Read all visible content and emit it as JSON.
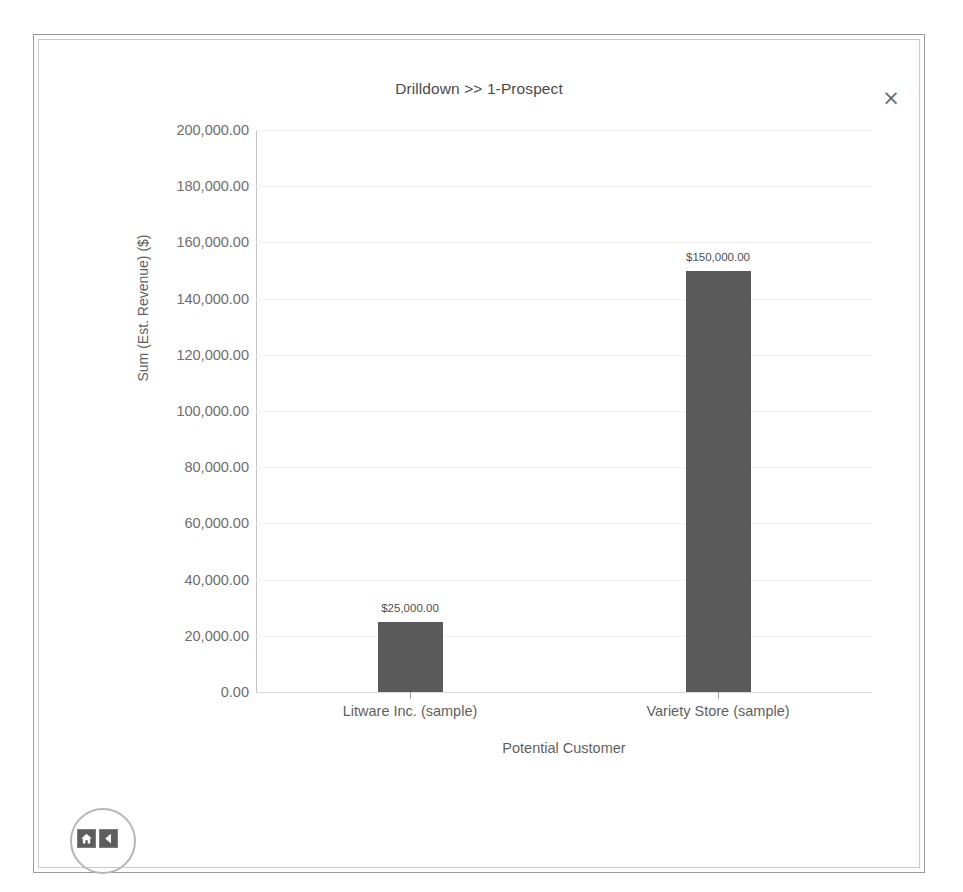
{
  "window": {
    "title": "Drilldown >> 1-Prospect",
    "close_label": "×"
  },
  "nav": {
    "home_icon": "home-icon",
    "back_icon": "chevron-left-icon"
  },
  "chart_data": {
    "type": "bar",
    "title": "Drilldown >> 1-Prospect",
    "xlabel": "Potential Customer",
    "ylabel": "Sum (Est. Revenue) ($)",
    "categories": [
      "Litware Inc. (sample)",
      "Variety Store (sample)"
    ],
    "values": [
      25000,
      150000
    ],
    "value_labels": [
      "$25,000.00",
      "$150,000.00"
    ],
    "ylim": [
      0,
      200000
    ],
    "ytick_values": [
      200000,
      180000,
      160000,
      140000,
      120000,
      100000,
      80000,
      60000,
      40000,
      20000,
      0
    ],
    "ytick_labels": [
      "200,000.00",
      "180,000.00",
      "160,000.00",
      "140,000.00",
      "120,000.00",
      "100,000.00",
      "80,000.00",
      "60,000.00",
      "40,000.00",
      "20,000.00",
      "0.00"
    ],
    "grid": true,
    "legend": false,
    "bar_color": "#5a5a5a",
    "gridline_color": "#f0f0f0",
    "axis_color": "#b8b8b8"
  }
}
